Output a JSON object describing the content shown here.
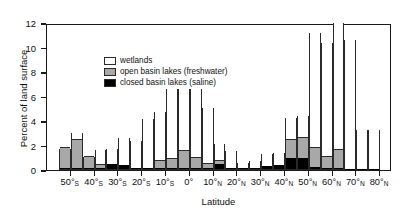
{
  "chart_data": {
    "type": "bar",
    "title": "",
    "xlabel": "Latitude",
    "ylabel": "Percent of land surface",
    "ylim": [
      0,
      12
    ],
    "ytick_values": [
      0,
      2,
      4,
      6,
      8,
      10,
      12
    ],
    "ytick_labels": [
      "0",
      "2",
      "4",
      "6",
      "8",
      "10",
      "12"
    ],
    "grid": false,
    "stacked": true,
    "bar_bin_width_degrees": 5,
    "xlim_degrees": [
      -60,
      85
    ],
    "xtick_degrees": [
      -50,
      -40,
      -30,
      -20,
      -10,
      0,
      10,
      20,
      30,
      40,
      50,
      60,
      70,
      80
    ],
    "xtick_labels": [
      {
        "value": "50",
        "hemisphere": "S"
      },
      {
        "value": "40",
        "hemisphere": "S"
      },
      {
        "value": "30",
        "hemisphere": "S"
      },
      {
        "value": "20",
        "hemisphere": "S"
      },
      {
        "value": "10",
        "hemisphere": "S"
      },
      {
        "value": "0",
        "hemisphere": ""
      },
      {
        "value": "10",
        "hemisphere": "N"
      },
      {
        "value": "20",
        "hemisphere": "N"
      },
      {
        "value": "30",
        "hemisphere": "N"
      },
      {
        "value": "40",
        "hemisphere": "N"
      },
      {
        "value": "50",
        "hemisphere": "N"
      },
      {
        "value": "60",
        "hemisphere": "N"
      },
      {
        "value": "70",
        "hemisphere": "N"
      },
      {
        "value": "80",
        "hemisphere": "N"
      }
    ],
    "legend": {
      "position": "top-left",
      "entries": [
        {
          "label": "wetlands",
          "color": "#ffffff",
          "key": "wetlands"
        },
        {
          "label": "open basin lakes (freshwater)",
          "color": "#a8a8a8",
          "key": "open"
        },
        {
          "label": "closed basin lakes (saline)",
          "color": "#000000",
          "key": "closed"
        }
      ]
    },
    "series": [
      {
        "name": "closed basin lakes (saline)",
        "color": "#000000"
      },
      {
        "name": "open basin lakes (freshwater)",
        "color": "#a8a8a8"
      },
      {
        "name": "wetlands",
        "color": "#ffffff"
      }
    ],
    "bins": [
      {
        "lat_start": -55,
        "lat_end": -50,
        "closed": 0.1,
        "open": 1.65,
        "wetlands": 0.0,
        "total": 1.75
      },
      {
        "lat_start": -50,
        "lat_end": -45,
        "closed": 0.1,
        "open": 2.3,
        "wetlands": 0.65,
        "total": 3.05
      },
      {
        "lat_start": -45,
        "lat_end": -40,
        "closed": 0.1,
        "open": 0.9,
        "wetlands": 0.05,
        "total": 1.05
      },
      {
        "lat_start": -40,
        "lat_end": -35,
        "closed": 0.12,
        "open": 0.2,
        "wetlands": 1.33,
        "total": 1.65
      },
      {
        "lat_start": -35,
        "lat_end": -30,
        "closed": 0.42,
        "open": 0.0,
        "wetlands": 1.28,
        "total": 1.7
      },
      {
        "lat_start": -30,
        "lat_end": -25,
        "closed": 0.32,
        "open": 0.0,
        "wetlands": 2.28,
        "total": 2.6
      },
      {
        "lat_start": -25,
        "lat_end": -20,
        "closed": 0.06,
        "open": 0.0,
        "wetlands": 2.28,
        "total": 2.34
      },
      {
        "lat_start": -20,
        "lat_end": -15,
        "closed": 0.05,
        "open": 0.0,
        "wetlands": 4.15,
        "total": 4.2
      },
      {
        "lat_start": -15,
        "lat_end": -10,
        "closed": 0.05,
        "open": 0.6,
        "wetlands": 4.05,
        "total": 4.7
      },
      {
        "lat_start": -10,
        "lat_end": -5,
        "closed": 0.06,
        "open": 0.78,
        "wetlands": 7.86,
        "total": 8.7
      },
      {
        "lat_start": -5,
        "lat_end": 0,
        "closed": 0.06,
        "open": 1.44,
        "wetlands": 7.9,
        "total": 9.4
      },
      {
        "lat_start": 0,
        "lat_end": 5,
        "closed": 0.06,
        "open": 0.88,
        "wetlands": 7.36,
        "total": 8.3
      },
      {
        "lat_start": 5,
        "lat_end": 10,
        "closed": 0.06,
        "open": 0.35,
        "wetlands": 4.69,
        "total": 5.1
      },
      {
        "lat_start": 10,
        "lat_end": 15,
        "closed": 0.42,
        "open": 0.25,
        "wetlands": 1.48,
        "total": 2.15
      },
      {
        "lat_start": 15,
        "lat_end": 20,
        "closed": 0.12,
        "open": 0.0,
        "wetlands": 1.43,
        "total": 1.55
      },
      {
        "lat_start": 20,
        "lat_end": 25,
        "closed": 0.1,
        "open": 0.0,
        "wetlands": 0.45,
        "total": 0.55
      },
      {
        "lat_start": 25,
        "lat_end": 30,
        "closed": 0.12,
        "open": 0.0,
        "wetlands": 0.62,
        "total": 0.74
      },
      {
        "lat_start": 30,
        "lat_end": 35,
        "closed": 0.22,
        "open": 0.0,
        "wetlands": 1.08,
        "total": 1.3
      },
      {
        "lat_start": 35,
        "lat_end": 40,
        "closed": 0.34,
        "open": 0.0,
        "wetlands": 1.01,
        "total": 1.35
      },
      {
        "lat_start": 40,
        "lat_end": 45,
        "closed": 0.86,
        "open": 1.55,
        "wetlands": 1.85,
        "total": 4.26
      },
      {
        "lat_start": 45,
        "lat_end": 50,
        "closed": 0.92,
        "open": 1.62,
        "wetlands": 1.86,
        "total": 4.4
      },
      {
        "lat_start": 50,
        "lat_end": 55,
        "closed": 0.2,
        "open": 1.52,
        "wetlands": 9.48,
        "total": 11.2
      },
      {
        "lat_start": 55,
        "lat_end": 60,
        "closed": 0.05,
        "open": 0.95,
        "wetlands": 9.4,
        "total": 10.4
      },
      {
        "lat_start": 60,
        "lat_end": 65,
        "closed": 0.06,
        "open": 1.5,
        "wetlands": 10.44,
        "total": 12.0
      },
      {
        "lat_start": 65,
        "lat_end": 70,
        "closed": 0.02,
        "open": 0.0,
        "wetlands": 10.58,
        "total": 10.6
      },
      {
        "lat_start": 70,
        "lat_end": 75,
        "closed": 0.02,
        "open": 0.0,
        "wetlands": 3.23,
        "total": 3.25
      },
      {
        "lat_start": 75,
        "lat_end": 80,
        "closed": 0.02,
        "open": 0.0,
        "wetlands": 3.23,
        "total": 3.25
      }
    ]
  }
}
